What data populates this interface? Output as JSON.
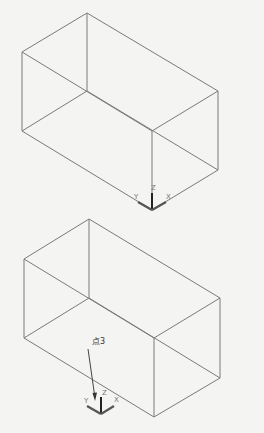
{
  "figures": [
    {
      "name": "box-before",
      "ucs": {
        "x_label": "X",
        "y_label": "Y",
        "z_label": "Z"
      }
    },
    {
      "name": "box-after",
      "ucs": {
        "x_label": "X",
        "y_label": "Y",
        "z_label": "Z"
      },
      "callout": {
        "text": "点3"
      }
    }
  ]
}
